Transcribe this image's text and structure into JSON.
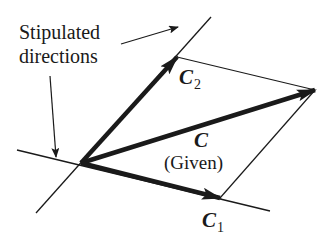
{
  "figure": {
    "annotation": {
      "line1": "Stipulated",
      "line2": "directions"
    },
    "vectors": {
      "c2": {
        "symbol": "C",
        "subscript": "2"
      },
      "c1": {
        "symbol": "C",
        "subscript": "1"
      },
      "c": {
        "symbol": "C",
        "note": "(Given)"
      }
    }
  },
  "colors": {
    "ink": "#1a1a1a",
    "background": "#ffffff"
  }
}
